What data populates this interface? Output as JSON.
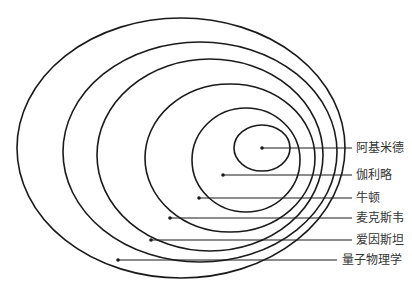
{
  "diagram": {
    "type": "nested-ellipses",
    "stroke_color": "#1a1a1a",
    "label_color": "#333333",
    "levels": [
      {
        "label": "阿基米德",
        "ellipse": {
          "cx": 262,
          "cy": 148,
          "rx": 28,
          "ry": 23
        },
        "dot": {
          "x": 262,
          "y": 148
        },
        "line_end_x": 352,
        "label_x": 356,
        "label_y": 148
      },
      {
        "label": "伽利略",
        "ellipse": {
          "cx": 246,
          "cy": 160,
          "rx": 54,
          "ry": 52
        },
        "dot": {
          "x": 223,
          "y": 175
        },
        "line_end_x": 352,
        "label_x": 356,
        "label_y": 175
      },
      {
        "label": "牛顿",
        "ellipse": {
          "cx": 230,
          "cy": 158,
          "rx": 85,
          "ry": 74
        },
        "dot": {
          "x": 199,
          "y": 198
        },
        "line_end_x": 352,
        "label_x": 356,
        "label_y": 198
      },
      {
        "label": "麦克斯韦",
        "ellipse": {
          "cx": 210,
          "cy": 155,
          "rx": 113,
          "ry": 96
        },
        "dot": {
          "x": 170,
          "y": 218
        },
        "line_end_x": 352,
        "label_x": 356,
        "label_y": 218
      },
      {
        "label": "爱因斯坦",
        "ellipse": {
          "cx": 200,
          "cy": 152,
          "rx": 137,
          "ry": 110
        },
        "dot": {
          "x": 151,
          "y": 240
        },
        "line_end_x": 352,
        "label_x": 356,
        "label_y": 240
      },
      {
        "label": "量子物理学",
        "ellipse": {
          "cx": 181,
          "cy": 148,
          "rx": 164,
          "ry": 130
        },
        "dot": {
          "x": 118,
          "y": 260
        },
        "line_end_x": 337,
        "label_x": 342,
        "label_y": 260
      }
    ]
  }
}
